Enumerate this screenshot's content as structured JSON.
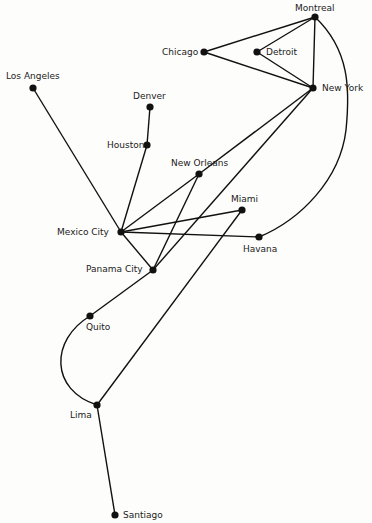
{
  "colors": {
    "line": "#111111",
    "node": "#111111",
    "background": "#fdfdfb"
  },
  "nodes": [
    {
      "id": "montreal",
      "label": "Montreal",
      "x": 315,
      "y": 17,
      "lx": 295,
      "ly": 3
    },
    {
      "id": "chicago",
      "label": "Chicago",
      "x": 204,
      "y": 52,
      "lx": 162,
      "ly": 47
    },
    {
      "id": "detroit",
      "label": "Detroit",
      "x": 257,
      "y": 52,
      "lx": 266,
      "ly": 47
    },
    {
      "id": "newyork",
      "label": "New York",
      "x": 313,
      "y": 88,
      "lx": 322,
      "ly": 83
    },
    {
      "id": "losangeles",
      "label": "Los Angeles",
      "x": 33,
      "y": 88,
      "lx": 6,
      "ly": 71
    },
    {
      "id": "denver",
      "label": "Denver",
      "x": 150,
      "y": 107,
      "lx": 133,
      "ly": 91
    },
    {
      "id": "houston",
      "label": "Houston",
      "x": 147,
      "y": 145,
      "lx": 107,
      "ly": 140
    },
    {
      "id": "neworleans",
      "label": "New Orleans",
      "x": 199,
      "y": 174,
      "lx": 171,
      "ly": 158
    },
    {
      "id": "miami",
      "label": "Miami",
      "x": 242,
      "y": 210,
      "lx": 231,
      "ly": 194
    },
    {
      "id": "mexicocity",
      "label": "Mexico City",
      "x": 121,
      "y": 232,
      "lx": 57,
      "ly": 227
    },
    {
      "id": "havana",
      "label": "Havana",
      "x": 259,
      "y": 237,
      "lx": 243,
      "ly": 244
    },
    {
      "id": "panamacity",
      "label": "Panama City",
      "x": 153,
      "y": 270,
      "lx": 86,
      "ly": 264
    },
    {
      "id": "quito",
      "label": "Quito",
      "x": 90,
      "y": 316,
      "lx": 86,
      "ly": 322
    },
    {
      "id": "lima",
      "label": "Lima",
      "x": 97,
      "y": 405,
      "lx": 70,
      "ly": 410
    },
    {
      "id": "santiago",
      "label": "Santiago",
      "x": 115,
      "y": 515,
      "lx": 123,
      "ly": 510
    }
  ],
  "edges": [
    [
      "chicago",
      "montreal"
    ],
    [
      "chicago",
      "newyork"
    ],
    [
      "detroit",
      "montreal"
    ],
    [
      "detroit",
      "newyork"
    ],
    [
      "montreal",
      "newyork"
    ],
    [
      "newyork",
      "neworleans"
    ],
    [
      "newyork",
      "panamacity"
    ],
    [
      "losangeles",
      "mexicocity"
    ],
    [
      "denver",
      "houston"
    ],
    [
      "houston",
      "mexicocity"
    ],
    [
      "mexicocity",
      "neworleans"
    ],
    [
      "mexicocity",
      "miami"
    ],
    [
      "mexicocity",
      "havana"
    ],
    [
      "mexicocity",
      "panamacity"
    ],
    [
      "neworleans",
      "panamacity"
    ],
    [
      "miami",
      "lima"
    ],
    [
      "panamacity",
      "quito"
    ],
    [
      "lima",
      "santiago"
    ]
  ],
  "curves": [
    {
      "from": "montreal",
      "to": "havana",
      "d": "M315,17 C350,50 350,90 346,130 C340,180 300,220 259,237"
    },
    {
      "from": "quito",
      "to": "lima",
      "d": "M90,316 C50,340 50,390 97,405"
    }
  ]
}
